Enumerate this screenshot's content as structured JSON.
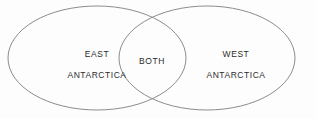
{
  "diagram": {
    "type": "venn-diagram",
    "set_count": 2,
    "background_color": "#fdfdfd",
    "stroke_color": "#8c8c8c",
    "text_color": "#2b2b2b",
    "left_set": {
      "label_line_1": "EAST",
      "label_line_2": "ANTARCTICA"
    },
    "intersection": {
      "label": "BOTH"
    },
    "right_set": {
      "label_line_1": "WEST",
      "label_line_2": "ANTARCTICA"
    }
  },
  "geometry": {
    "left_ellipse": {
      "cx": 97,
      "cy": 58,
      "rx": 89,
      "ry": 52
    },
    "right_ellipse": {
      "cx": 207,
      "cy": 58,
      "rx": 88,
      "ry": 52
    }
  }
}
